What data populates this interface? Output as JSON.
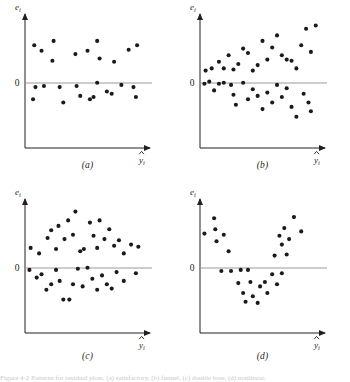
{
  "figure": {
    "axis_labels": {
      "y": "e",
      "y_sub": "i",
      "x": "y",
      "x_sub": "i",
      "x_hat": true
    },
    "zero_label": "0",
    "caption_cut": "Figure  4-2  Patterns for residual plots.  (a) satisfactory,  (b) funnel,  (c) double bow,  (d) nonlinear."
  },
  "panels": [
    {
      "key": "a",
      "label": "(a)",
      "pattern": "satisfactory"
    },
    {
      "key": "b",
      "label": "(b)",
      "pattern": "funnel"
    },
    {
      "key": "c",
      "label": "(c)",
      "pattern": "double-bow"
    },
    {
      "key": "d",
      "label": "(d)",
      "pattern": "nonlinear"
    }
  ],
  "chart_data": [
    {
      "type": "scatter",
      "title": "(a)",
      "xlabel": "y-hat_i",
      "ylabel": "e_i",
      "pattern": "satisfactory",
      "xlim": [
        0,
        100
      ],
      "ylim": [
        -50,
        50
      ],
      "zero_line": 0,
      "grid": false,
      "points": [
        {
          "x": 6,
          "y": 27
        },
        {
          "x": 12,
          "y": 22
        },
        {
          "x": 22,
          "y": 31
        },
        {
          "x": 21,
          "y": 13
        },
        {
          "x": 40,
          "y": 19
        },
        {
          "x": 50,
          "y": 22
        },
        {
          "x": 58,
          "y": 31
        },
        {
          "x": 60,
          "y": 15
        },
        {
          "x": 72,
          "y": 12
        },
        {
          "x": 84,
          "y": 23
        },
        {
          "x": 91,
          "y": 27
        },
        {
          "x": 7,
          "y": -11
        },
        {
          "x": 5,
          "y": -22
        },
        {
          "x": 14,
          "y": -10
        },
        {
          "x": 27,
          "y": -11
        },
        {
          "x": 30,
          "y": -25
        },
        {
          "x": 41,
          "y": -10
        },
        {
          "x": 44,
          "y": -19
        },
        {
          "x": 52,
          "y": -22
        },
        {
          "x": 55,
          "y": -20
        },
        {
          "x": 58,
          "y": -7
        },
        {
          "x": 66,
          "y": -15
        },
        {
          "x": 70,
          "y": -17
        },
        {
          "x": 78,
          "y": -9
        },
        {
          "x": 88,
          "y": -11
        },
        {
          "x": 90,
          "y": -20
        }
      ]
    },
    {
      "type": "scatter",
      "title": "(b)",
      "xlabel": "y-hat_i",
      "ylabel": "e_i",
      "pattern": "funnel",
      "xlim": [
        0,
        100
      ],
      "ylim": [
        -50,
        50
      ],
      "zero_line": 0,
      "grid": false,
      "points": [
        {
          "x": 3,
          "y": 4
        },
        {
          "x": 8,
          "y": 6
        },
        {
          "x": 14,
          "y": 12
        },
        {
          "x": 18,
          "y": 6
        },
        {
          "x": 22,
          "y": 18
        },
        {
          "x": 26,
          "y": 5
        },
        {
          "x": 30,
          "y": 10
        },
        {
          "x": 34,
          "y": 24
        },
        {
          "x": 38,
          "y": 20
        },
        {
          "x": 42,
          "y": 4
        },
        {
          "x": 46,
          "y": 9
        },
        {
          "x": 50,
          "y": 31
        },
        {
          "x": 54,
          "y": 14
        },
        {
          "x": 58,
          "y": 25
        },
        {
          "x": 62,
          "y": 36
        },
        {
          "x": 66,
          "y": 18
        },
        {
          "x": 70,
          "y": 14
        },
        {
          "x": 74,
          "y": 13
        },
        {
          "x": 78,
          "y": 6
        },
        {
          "x": 82,
          "y": 27
        },
        {
          "x": 86,
          "y": 42
        },
        {
          "x": 90,
          "y": 21
        },
        {
          "x": 94,
          "y": 45
        },
        {
          "x": 2,
          "y": -8
        },
        {
          "x": 6,
          "y": -6
        },
        {
          "x": 10,
          "y": -14
        },
        {
          "x": 14,
          "y": -8
        },
        {
          "x": 18,
          "y": -7
        },
        {
          "x": 24,
          "y": -9
        },
        {
          "x": 26,
          "y": -18
        },
        {
          "x": 28,
          "y": -27
        },
        {
          "x": 34,
          "y": -7
        },
        {
          "x": 38,
          "y": -22
        },
        {
          "x": 42,
          "y": -13
        },
        {
          "x": 46,
          "y": -19
        },
        {
          "x": 50,
          "y": -31
        },
        {
          "x": 54,
          "y": -16
        },
        {
          "x": 58,
          "y": -25
        },
        {
          "x": 62,
          "y": -9
        },
        {
          "x": 66,
          "y": -20
        },
        {
          "x": 70,
          "y": -12
        },
        {
          "x": 74,
          "y": -29
        },
        {
          "x": 78,
          "y": -38
        },
        {
          "x": 84,
          "y": -17
        },
        {
          "x": 88,
          "y": -25
        },
        {
          "x": 90,
          "y": -33
        }
      ]
    },
    {
      "type": "scatter",
      "title": "(c)",
      "xlabel": "y-hat_i",
      "ylabel": "e_i",
      "pattern": "double-bow",
      "xlim": [
        0,
        100
      ],
      "ylim": [
        -50,
        50
      ],
      "zero_line": 0,
      "grid": false,
      "points": [
        {
          "x": 3,
          "y": 11
        },
        {
          "x": 10,
          "y": 6
        },
        {
          "x": 17,
          "y": 20
        },
        {
          "x": 20,
          "y": 27
        },
        {
          "x": 24,
          "y": 10
        },
        {
          "x": 26,
          "y": 31
        },
        {
          "x": 31,
          "y": 19
        },
        {
          "x": 34,
          "y": 36
        },
        {
          "x": 38,
          "y": 23
        },
        {
          "x": 40,
          "y": 44
        },
        {
          "x": 44,
          "y": 8
        },
        {
          "x": 47,
          "y": 10
        },
        {
          "x": 52,
          "y": 34
        },
        {
          "x": 55,
          "y": 22
        },
        {
          "x": 58,
          "y": 11
        },
        {
          "x": 60,
          "y": 36
        },
        {
          "x": 64,
          "y": 19
        },
        {
          "x": 68,
          "y": 28
        },
        {
          "x": 72,
          "y": 13
        },
        {
          "x": 76,
          "y": 18
        },
        {
          "x": 80,
          "y": 6
        },
        {
          "x": 86,
          "y": 14
        },
        {
          "x": 92,
          "y": 12
        },
        {
          "x": 2,
          "y": -9
        },
        {
          "x": 8,
          "y": -16
        },
        {
          "x": 12,
          "y": -13
        },
        {
          "x": 16,
          "y": -27
        },
        {
          "x": 20,
          "y": -22
        },
        {
          "x": 24,
          "y": -9
        },
        {
          "x": 27,
          "y": -19
        },
        {
          "x": 30,
          "y": -36
        },
        {
          "x": 35,
          "y": -36
        },
        {
          "x": 38,
          "y": -22
        },
        {
          "x": 42,
          "y": -8
        },
        {
          "x": 46,
          "y": -24
        },
        {
          "x": 50,
          "y": -7
        },
        {
          "x": 54,
          "y": -17
        },
        {
          "x": 58,
          "y": -27
        },
        {
          "x": 62,
          "y": -14
        },
        {
          "x": 66,
          "y": -22
        },
        {
          "x": 70,
          "y": -26
        },
        {
          "x": 74,
          "y": -11
        },
        {
          "x": 80,
          "y": -19
        },
        {
          "x": 90,
          "y": -12
        }
      ]
    },
    {
      "type": "scatter",
      "title": "(d)",
      "xlabel": "y-hat_i",
      "ylabel": "e_i",
      "pattern": "nonlinear",
      "xlim": [
        0,
        100
      ],
      "ylim": [
        -50,
        50
      ],
      "zero_line": 0,
      "grid": false,
      "points": [
        {
          "x": 2,
          "y": 24
        },
        {
          "x": 10,
          "y": 38
        },
        {
          "x": 11,
          "y": 28
        },
        {
          "x": 12,
          "y": 17
        },
        {
          "x": 18,
          "y": 23
        },
        {
          "x": 22,
          "y": 8
        },
        {
          "x": 60,
          "y": 4
        },
        {
          "x": 64,
          "y": 22
        },
        {
          "x": 66,
          "y": 14
        },
        {
          "x": 68,
          "y": 29
        },
        {
          "x": 70,
          "y": 5
        },
        {
          "x": 72,
          "y": 19
        },
        {
          "x": 76,
          "y": 39
        },
        {
          "x": 82,
          "y": 26
        },
        {
          "x": 16,
          "y": -10
        },
        {
          "x": 24,
          "y": -10
        },
        {
          "x": 30,
          "y": -21
        },
        {
          "x": 32,
          "y": -9
        },
        {
          "x": 34,
          "y": -30
        },
        {
          "x": 36,
          "y": -38
        },
        {
          "x": 38,
          "y": -9
        },
        {
          "x": 40,
          "y": -20
        },
        {
          "x": 42,
          "y": -33
        },
        {
          "x": 46,
          "y": -39
        },
        {
          "x": 48,
          "y": -24
        },
        {
          "x": 52,
          "y": -20
        },
        {
          "x": 54,
          "y": -30
        },
        {
          "x": 58,
          "y": -13
        },
        {
          "x": 62,
          "y": -22
        },
        {
          "x": 66,
          "y": -12
        }
      ]
    }
  ]
}
